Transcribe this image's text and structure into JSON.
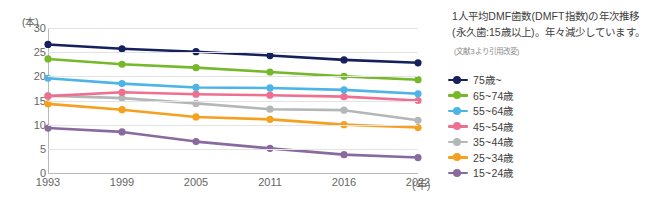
{
  "chart_data": {
    "type": "line",
    "title": "1人平均DMF歯数(DMFT指数)の年次推移",
    "subtitle": "(永久歯:15歳以上)。年々減少しています。",
    "source_note": "(文献3より引用改変)",
    "xlabel": "(年)",
    "ylabel": "(本)",
    "x": [
      "1993",
      "1999",
      "2005",
      "2011",
      "2016",
      "2022"
    ],
    "categories": [
      "1993",
      "1999",
      "2005",
      "2011",
      "2016",
      "2022"
    ],
    "ylim": [
      0,
      30
    ],
    "yticks": [
      "0",
      "5",
      "10",
      "15",
      "20",
      "25",
      "30"
    ],
    "grid": true,
    "legend_position": "right",
    "series": [
      {
        "name": "75歳~",
        "color": "#16205c",
        "values": [
          26.6,
          25.7,
          25.1,
          24.3,
          23.4,
          22.8
        ]
      },
      {
        "name": "65~74歳",
        "color": "#76b82a",
        "values": [
          23.6,
          22.5,
          21.8,
          20.9,
          20.0,
          19.3
        ]
      },
      {
        "name": "55~64歳",
        "color": "#4cb4e7",
        "values": [
          19.6,
          18.5,
          17.7,
          17.6,
          17.2,
          16.4
        ]
      },
      {
        "name": "45~54歳",
        "color": "#ef6f91",
        "values": [
          15.9,
          16.7,
          16.3,
          16.1,
          15.8,
          15.0
        ]
      },
      {
        "name": "35~44歳",
        "color": "#b3b8b6",
        "values": [
          16.0,
          15.5,
          14.4,
          13.2,
          13.0,
          10.9
        ]
      },
      {
        "name": "25~34歳",
        "color": "#f5a11f",
        "values": [
          14.3,
          13.1,
          11.6,
          11.1,
          10.0,
          9.4
        ]
      },
      {
        "name": "15~24歳",
        "color": "#8a6a9e",
        "values": [
          9.3,
          8.5,
          6.5,
          5.1,
          3.8,
          3.2
        ]
      }
    ]
  }
}
